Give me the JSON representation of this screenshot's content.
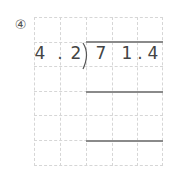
{
  "problem": {
    "number": "④",
    "divisor": [
      "4",
      ".",
      "2"
    ],
    "dividend": [
      "7",
      "",
      "1",
      ".",
      "4"
    ],
    "colors": {
      "text": "#444444",
      "grid": "#d6d6d6",
      "rule": "#8a8a8a"
    }
  }
}
